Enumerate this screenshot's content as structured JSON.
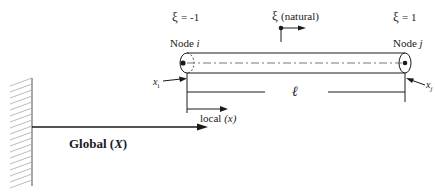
{
  "diagram": {
    "xi_left": {
      "symbol": "ξ",
      "value": "= -1"
    },
    "xi_natural": {
      "symbol": "ξ",
      "label": "(natural)"
    },
    "xi_right": {
      "symbol": "ξ",
      "value": "= 1"
    },
    "node_i": {
      "prefix": "Node",
      "id": "i"
    },
    "node_j": {
      "prefix": "Node",
      "id": "j"
    },
    "coord_i": {
      "base": "x",
      "sub": "i"
    },
    "coord_j": {
      "base": "x",
      "sub": "j"
    },
    "length_symbol": "ℓ",
    "local_axis": {
      "prefix": "local",
      "var": "(x)"
    },
    "global_axis": {
      "prefix": "Global",
      "open": "(",
      "var": "X",
      "close": ")"
    },
    "colors": {
      "line": "#1a1a1a",
      "hatch": "#9a9a9a",
      "background": "#ffffff"
    }
  }
}
